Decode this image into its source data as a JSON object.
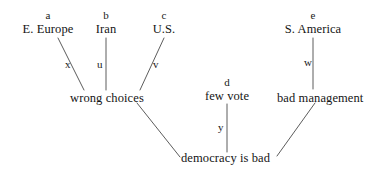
{
  "diagram": {
    "background_color": "#ffffff",
    "line_color": "#4a4a4a",
    "text_color": "#141414",
    "nodes": [
      {
        "id": "e-europe",
        "tag": "a",
        "label": "E. Europe"
      },
      {
        "id": "iran",
        "tag": "b",
        "label": "Iran"
      },
      {
        "id": "us",
        "tag": "c",
        "label": "U.S."
      },
      {
        "id": "s-america",
        "tag": "e",
        "label": "S. America"
      },
      {
        "id": "few-vote",
        "tag": "d",
        "label": "few vote"
      },
      {
        "id": "wrong-choices",
        "tag": "",
        "label": "wrong choices"
      },
      {
        "id": "bad-management",
        "tag": "",
        "label": "bad management"
      },
      {
        "id": "democracy-is-bad",
        "tag": "",
        "label": "democracy is bad"
      }
    ],
    "edges": [
      {
        "id": "x",
        "label": "x",
        "from": "e-europe",
        "to": "wrong-choices"
      },
      {
        "id": "u",
        "label": "u",
        "from": "iran",
        "to": "wrong-choices"
      },
      {
        "id": "v",
        "label": "v",
        "from": "us",
        "to": "wrong-choices"
      },
      {
        "id": "w",
        "label": "w",
        "from": "s-america",
        "to": "bad-management"
      },
      {
        "id": "y",
        "label": "y",
        "from": "few-vote",
        "to": "democracy-is-bad"
      },
      {
        "id": "wc-db",
        "label": "",
        "from": "wrong-choices",
        "to": "democracy-is-bad"
      },
      {
        "id": "bm-db",
        "label": "",
        "from": "bad-management",
        "to": "democracy-is-bad"
      }
    ]
  }
}
